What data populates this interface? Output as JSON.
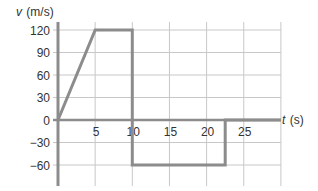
{
  "chart_data": {
    "type": "line",
    "title": "",
    "xlabel": "t (s)",
    "xlabel_var": "t",
    "xlabel_unit": "(s)",
    "ylabel": "v (m/s)",
    "ylabel_var": "v",
    "ylabel_unit": "(m/s)",
    "xlim": [
      0,
      30
    ],
    "ylim": [
      -75,
      130
    ],
    "x_ticks": [
      5,
      10,
      15,
      20,
      25
    ],
    "x_tick_labels": [
      "5",
      "10",
      "15",
      "20",
      "25"
    ],
    "x_grid": [
      5,
      10,
      15,
      20,
      25,
      30
    ],
    "y_ticks": [
      120,
      90,
      60,
      30,
      0,
      -30,
      -60
    ],
    "y_tick_labels": [
      "120",
      "90",
      "60",
      "30",
      "0",
      "−30",
      "−60"
    ],
    "grid": true,
    "legend": null,
    "series": [
      {
        "name": "velocity",
        "x": [
          0,
          5,
          10,
          10,
          22.5,
          22.5,
          30
        ],
        "y": [
          0,
          120,
          120,
          -60,
          -60,
          0,
          0
        ]
      }
    ],
    "colors": {
      "line": "#8c8c8c",
      "axis": "#8c8c8c",
      "grid": "#c8c8c8",
      "text": "#333333"
    }
  }
}
